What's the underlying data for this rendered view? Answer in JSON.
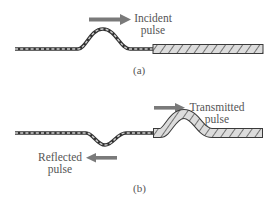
{
  "panel_a": {
    "caption": "(a)",
    "incident_label_line1": "Incident",
    "incident_label_line2": "pulse"
  },
  "panel_b": {
    "caption": "(b)",
    "transmitted_label_line1": "Transmitted",
    "transmitted_label_line2": "pulse",
    "reflected_label_line1": "Reflected",
    "reflected_label_line2": "pulse"
  },
  "colors": {
    "arrow": "#7a7a7a",
    "rope_outline": "#3a3a3a",
    "thick_rope_fill": "#d8d8d8",
    "text": "#555555"
  }
}
